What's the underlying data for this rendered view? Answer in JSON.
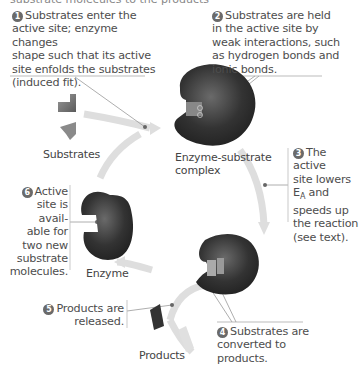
{
  "top_cut_text": "substrate molecules to the products",
  "steps": [
    {
      "n": "1",
      "lines": [
        "Substrates enter the",
        "active site; enzyme changes",
        "shape such that its active",
        "site enfolds the substrates",
        "(induced fit)."
      ]
    },
    {
      "n": "2",
      "lines": [
        "Substrates are held",
        "in the active site by",
        "weak interactions, such",
        "as hydrogen bonds and",
        "ionic bonds."
      ]
    },
    {
      "n": "3",
      "lines": [
        "The active",
        "site lowers",
        "E",
        "and",
        "speeds up",
        "the reaction",
        "(see text)."
      ],
      "subscript": "A"
    },
    {
      "n": "4",
      "lines": [
        "Substrates are",
        "converted to",
        "products."
      ]
    },
    {
      "n": "5",
      "lines": [
        "Products are",
        "released."
      ]
    },
    {
      "n": "6",
      "lines": [
        "Active",
        "site is",
        "avail-",
        "able for",
        "two new",
        "substrate",
        "molecules."
      ]
    }
  ],
  "labels": {
    "substrates": "Substrates",
    "complex_line1": "Enzyme-substrate",
    "complex_line2": "complex",
    "enzyme": "Enzyme",
    "products": "Products"
  },
  "colors": {
    "enzyme": "#2e2e2e",
    "arrow": "#dcdcdc",
    "substrate": "#7a7a7a",
    "leader": "#999999",
    "badge": "#6a6a6a"
  }
}
